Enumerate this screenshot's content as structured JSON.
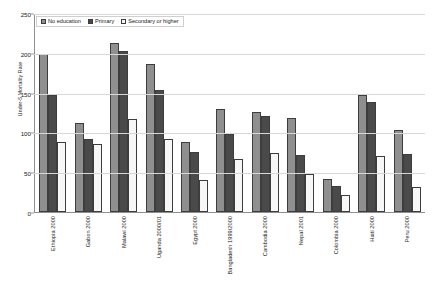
{
  "chart_data": {
    "type": "bar",
    "title": "",
    "xlabel": "",
    "ylabel": "Under-5 Mortality Rate",
    "ylim": [
      0,
      250
    ],
    "yticks": [
      0,
      50,
      100,
      150,
      200,
      250
    ],
    "grid": true,
    "legend_position": "top-left",
    "categories": [
      "Ethiopia 2000",
      "Gabon 2000",
      "Malawi 2000",
      "Uganda 2000/01",
      "Egypt 2000",
      "Bangladesh 1999/2000",
      "Cambodia 2000",
      "Nepal 2001",
      "Colombia 2000",
      "Haiti 2000",
      "Peru 2000"
    ],
    "series": [
      {
        "name": "No education",
        "color": "#8f8f8f",
        "values": [
          198,
          112,
          212,
          186,
          88,
          129,
          126,
          118,
          41,
          147,
          103
        ]
      },
      {
        "name": "Primary",
        "color": "#4a4a4a",
        "values": [
          147,
          92,
          202,
          153,
          75,
          98,
          120,
          71,
          33,
          138,
          73
        ]
      },
      {
        "name": "Secondary or higher",
        "color": "#f7f7f7",
        "values": [
          88,
          86,
          117,
          92,
          40,
          66,
          74,
          48,
          22,
          70,
          32
        ]
      }
    ]
  },
  "legend": {
    "items": [
      {
        "label": "No education"
      },
      {
        "label": "Primary"
      },
      {
        "label": "Secondary or higher"
      }
    ]
  },
  "axes": {
    "y_title": "Under-5 Mortality Rate",
    "y_tick_labels": [
      "250",
      "200",
      "150",
      "100",
      "50",
      "0"
    ]
  }
}
